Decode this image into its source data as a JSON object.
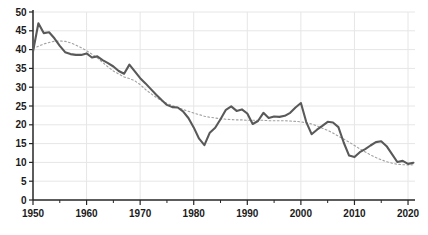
{
  "chart_data": {
    "type": "line",
    "title": "",
    "xlabel": "",
    "ylabel": "",
    "xlim": [
      1950,
      2021.3
    ],
    "ylim": [
      0,
      50
    ],
    "grid": true,
    "legend": "none",
    "x": [
      1950,
      1951,
      1952,
      1953,
      1954,
      1955,
      1956,
      1957,
      1958,
      1959,
      1960,
      1961,
      1962,
      1963,
      1964,
      1965,
      1966,
      1967,
      1968,
      1969,
      1970,
      1971,
      1972,
      1973,
      1974,
      1975,
      1976,
      1977,
      1978,
      1979,
      1980,
      1981,
      1982,
      1983,
      1984,
      1985,
      1986,
      1987,
      1988,
      1989,
      1990,
      1991,
      1992,
      1993,
      1994,
      1995,
      1996,
      1997,
      1998,
      1999,
      2000,
      2001,
      2002,
      2003,
      2004,
      2005,
      2006,
      2007,
      2008,
      2009,
      2010,
      2011,
      2012,
      2013,
      2014,
      2015,
      2016,
      2017,
      2018,
      2019,
      2020,
      2021
    ],
    "series": [
      {
        "name": "observed-series",
        "style": "solid",
        "color": "#595959",
        "width": 2.1,
        "values": [
          39.5,
          47.0,
          44.4,
          44.6,
          43.0,
          41.0,
          39.3,
          38.8,
          38.6,
          38.6,
          39.0,
          37.9,
          38.2,
          37.2,
          36.4,
          35.5,
          34.3,
          33.6,
          36.0,
          34.2,
          32.4,
          31.0,
          29.5,
          28.0,
          26.6,
          25.3,
          24.7,
          24.6,
          23.6,
          21.8,
          19.3,
          16.3,
          14.6,
          17.9,
          19.2,
          21.5,
          24.0,
          24.9,
          23.7,
          24.1,
          23.0,
          20.2,
          21.0,
          23.2,
          21.8,
          22.2,
          22.1,
          22.4,
          23.2,
          24.6,
          25.8,
          20.8,
          17.5,
          18.7,
          19.7,
          20.8,
          20.6,
          19.4,
          15.3,
          11.8,
          11.4,
          12.7,
          13.5,
          14.5,
          15.4,
          15.6,
          14.3,
          12.2,
          10.1,
          10.4,
          9.6,
          9.9
        ]
      },
      {
        "name": "trend-series",
        "style": "dotted",
        "color": "#a0a0a0",
        "width": 1.1,
        "values": [
          40.3,
          40.9,
          41.5,
          41.9,
          42.2,
          42.3,
          42.2,
          41.8,
          41.2,
          40.5,
          39.7,
          38.8,
          37.8,
          36.6,
          35.4,
          34.3,
          33.5,
          32.7,
          32.3,
          31.7,
          30.7,
          29.4,
          28.3,
          27.3,
          26.4,
          25.7,
          25.1,
          24.6,
          24.1,
          23.6,
          23.1,
          22.7,
          22.3,
          22.0,
          21.8,
          21.6,
          21.5,
          21.4,
          21.3,
          21.3,
          21.2,
          21.2,
          21.2,
          21.2,
          21.1,
          21.1,
          21.1,
          21.1,
          21.0,
          20.9,
          20.8,
          20.5,
          20.2,
          19.7,
          19.1,
          18.5,
          17.8,
          17.0,
          16.2,
          15.4,
          14.5,
          13.6,
          12.8,
          12.0,
          11.3,
          10.7,
          10.2,
          9.8,
          9.5,
          9.4,
          9.3,
          9.4
        ]
      }
    ],
    "xticks_major": [
      1950,
      1960,
      1970,
      1980,
      1990,
      2000,
      2010,
      2020
    ],
    "x_tick_labels": [
      "1950",
      "1960",
      "1970",
      "1980",
      "1990",
      "2000",
      "2010",
      "2020"
    ],
    "xticks_minor": [
      1955,
      1965,
      1975,
      1985,
      1995,
      2005,
      2015
    ],
    "yticks": [
      0,
      5,
      10,
      15,
      20,
      25,
      30,
      35,
      40,
      45,
      50
    ],
    "y_tick_labels": [
      "0",
      "5",
      "10",
      "15",
      "20",
      "25",
      "30",
      "35",
      "40",
      "45",
      "50"
    ]
  },
  "colors": {
    "background": "#ffffff",
    "grid": "#e6e6e6",
    "axis": "#262626",
    "tick": "#262626",
    "label": "#1a1a1a"
  }
}
